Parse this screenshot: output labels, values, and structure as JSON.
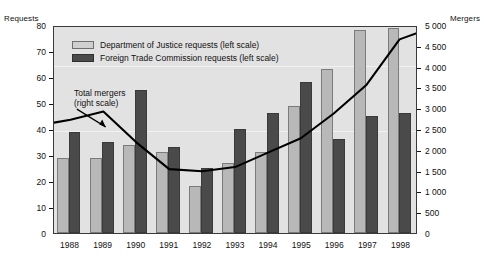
{
  "chart_data": {
    "type": "bar",
    "title": "",
    "subtitle": "",
    "xlabel": "",
    "ylabel": "Requests",
    "y2label": "Mergers",
    "categories": [
      "1988",
      "1989",
      "1990",
      "1991",
      "1992",
      "1993",
      "1994",
      "1995",
      "1996",
      "1997",
      "1998"
    ],
    "ylim": [
      0,
      80
    ],
    "y2lim": [
      0,
      5000
    ],
    "yticks": [
      "0",
      "10",
      "20",
      "30",
      "40",
      "50",
      "60",
      "70",
      "80"
    ],
    "ytick_values": [
      0,
      10,
      20,
      30,
      40,
      50,
      60,
      70,
      80
    ],
    "y2ticks": [
      "0",
      "500",
      "1 000",
      "1 500",
      "2 000",
      "2 500",
      "3 000",
      "3 500",
      "4 000",
      "4 500",
      "5 000"
    ],
    "y2tick_values": [
      0,
      500,
      1000,
      1500,
      2000,
      2500,
      3000,
      3500,
      4000,
      4500,
      5000
    ],
    "grid": false,
    "legend_position": "top-left",
    "series": [
      {
        "name": "Department of Justice requests (left scale)",
        "type": "bar",
        "axis": "left",
        "color": "#b8b8b8",
        "values": [
          29,
          29,
          34,
          31,
          18,
          27,
          31,
          49,
          63,
          78,
          79
        ]
      },
      {
        "name": "Foreign Trade Commission requests (left scale)",
        "type": "bar",
        "axis": "left",
        "color": "#4a4a4a",
        "values": [
          39,
          35,
          55,
          33,
          25,
          40,
          46,
          58,
          36,
          45,
          46
        ]
      },
      {
        "name": "Total mergers (right scale)",
        "type": "line",
        "axis": "right",
        "color": "#000000",
        "values": [
          2750,
          2950,
          2200,
          1550,
          1500,
          1600,
          1950,
          2300,
          2900,
          3600,
          4700
        ]
      }
    ],
    "annotations": [
      {
        "name": "total-mergers-callout",
        "text_line1": "Total mergers",
        "text_line2": "(right scale)",
        "arrow": true
      }
    ]
  },
  "axes": {
    "left_title": "Requests",
    "right_title": "Mergers"
  },
  "legend": {
    "items": [
      {
        "label": "Department of Justice requests (left scale)",
        "swatch": "doj"
      },
      {
        "label": "Foreign Trade Commission requests (left scale)",
        "swatch": "ftc"
      }
    ]
  }
}
